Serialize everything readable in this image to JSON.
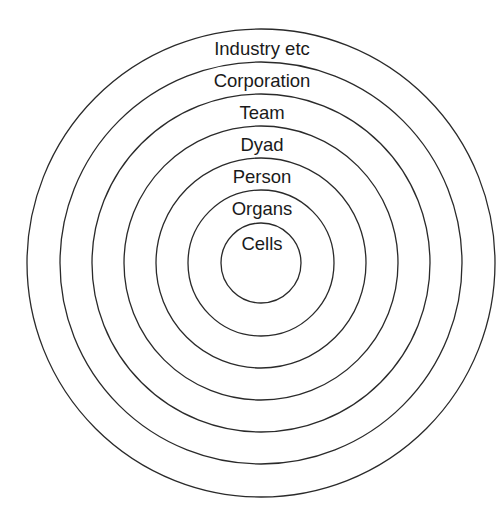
{
  "diagram": {
    "type": "concentric-circles",
    "center": {
      "x": 261,
      "y": 263
    },
    "line_color": "#2a2a2a",
    "text_color": "#1a1a1a",
    "rings": [
      {
        "label": "Industry etc",
        "radius": 234,
        "label_y": 55
      },
      {
        "label": "Corporation",
        "radius": 201,
        "label_y": 87
      },
      {
        "label": "Team",
        "radius": 169,
        "label_y": 119
      },
      {
        "label": "Dyad",
        "radius": 137,
        "label_y": 151
      },
      {
        "label": "Person",
        "radius": 105,
        "label_y": 183
      },
      {
        "label": "Organs",
        "radius": 73,
        "label_y": 215
      },
      {
        "label": "Cells",
        "radius": 40,
        "label_y": 250
      }
    ]
  }
}
